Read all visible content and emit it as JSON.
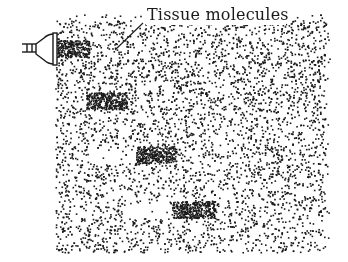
{
  "diagram": {
    "label": "Tissue molecules",
    "ink_color": "#1a1a1a",
    "background": "#ffffff",
    "transducer": {
      "name": "ultrasound-transducer",
      "x": 22,
      "y": 34,
      "w": 35,
      "h": 30
    },
    "field": {
      "x": 55,
      "y": 14,
      "w": 275,
      "h": 238
    },
    "leader_line": {
      "x1": 115,
      "y1": 50,
      "x2": 143,
      "y2": 23
    },
    "pulses": [
      {
        "x": 57,
        "y": 40,
        "w": 32,
        "h": 17
      },
      {
        "x": 86,
        "y": 92,
        "w": 41,
        "h": 17
      },
      {
        "x": 136,
        "y": 146,
        "w": 40,
        "h": 17
      },
      {
        "x": 172,
        "y": 201,
        "w": 43,
        "h": 17
      }
    ],
    "rarefactions": [
      {
        "x": 90,
        "y": 148,
        "w": 45,
        "h": 15
      },
      {
        "x": 126,
        "y": 203,
        "w": 45,
        "h": 15
      }
    ]
  }
}
